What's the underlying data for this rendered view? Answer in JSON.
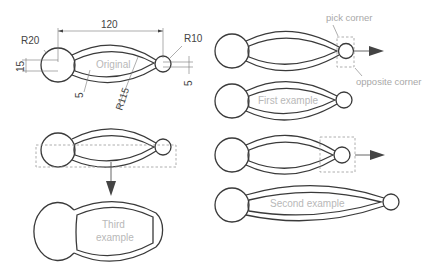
{
  "diagram": {
    "dimensions": {
      "length": "120",
      "big_radius": "R20",
      "small_radius": "R10",
      "neck_width": "15",
      "wall_thickness": "5",
      "arc_radius": "R115",
      "small_gap": "5"
    },
    "shapes": {
      "original": {
        "label": "Original"
      },
      "first": {
        "label": "First example"
      },
      "second": {
        "label": "Second example"
      },
      "third": {
        "label_line1": "Third",
        "label_line2": "example"
      }
    },
    "annotations": {
      "pick_corner": "pick corner",
      "opposite_corner": "opposite corner"
    },
    "colors": {
      "outline": "#3a3a3a",
      "label_text": "#b8b8b8",
      "dashed_box": "#9a9a9a"
    }
  }
}
